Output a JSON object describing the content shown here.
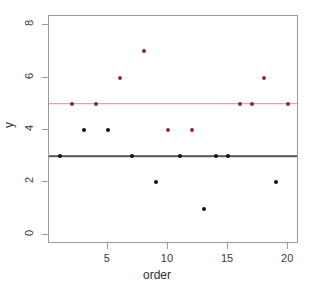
{
  "chart_data": {
    "type": "scatter",
    "title": "",
    "xlabel": "order",
    "ylabel": "y",
    "xlim": [
      0.1,
      20.9
    ],
    "ylim": [
      -0.35,
      8.35
    ],
    "grid": false,
    "legend": "none",
    "x_ticks": [
      5,
      10,
      15,
      20
    ],
    "y_ticks": [
      0,
      2,
      4,
      6,
      8
    ],
    "x_tick_labels": [
      "5",
      "10",
      "15",
      "20"
    ],
    "y_tick_labels": [
      "0",
      "2",
      "4",
      "6",
      "8"
    ],
    "series": [
      {
        "name": "black-points",
        "color": "#111111",
        "points": [
          {
            "x": 1,
            "y": 3
          },
          {
            "x": 3,
            "y": 4
          },
          {
            "x": 5,
            "y": 4
          },
          {
            "x": 7,
            "y": 3
          },
          {
            "x": 9,
            "y": 2
          },
          {
            "x": 11,
            "y": 3
          },
          {
            "x": 13,
            "y": 1
          },
          {
            "x": 14,
            "y": 3
          },
          {
            "x": 15,
            "y": 3
          },
          {
            "x": 19,
            "y": 2
          }
        ]
      },
      {
        "name": "red-points",
        "color": "#8b2a3a",
        "points": [
          {
            "x": 2,
            "y": 5
          },
          {
            "x": 4,
            "y": 5
          },
          {
            "x": 6,
            "y": 6
          },
          {
            "x": 8,
            "y": 7
          },
          {
            "x": 10,
            "y": 4
          },
          {
            "x": 12,
            "y": 4
          },
          {
            "x": 16,
            "y": 5
          },
          {
            "x": 17,
            "y": 5
          },
          {
            "x": 18,
            "y": 6
          },
          {
            "x": 20,
            "y": 5
          }
        ]
      }
    ],
    "reference_lines": [
      {
        "name": "red-mean-line",
        "orientation": "horizontal",
        "y": 5,
        "color": "#f47f8e"
      },
      {
        "name": "black-mean-line",
        "orientation": "horizontal",
        "y": 3,
        "color": "#555555"
      }
    ]
  },
  "axes": {
    "x_title": "order",
    "y_title": "y"
  }
}
